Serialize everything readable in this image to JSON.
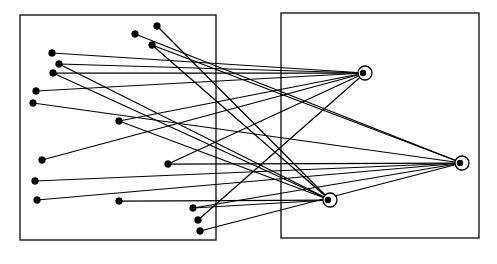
{
  "figure": {
    "canvas": {
      "width": 497,
      "height": 264
    },
    "background_color": "#ffffff",
    "stroke_color": "#000000",
    "box_stroke_color": "#1a1a1a"
  },
  "regions": [
    {
      "name": "left-region",
      "x": 20,
      "y": 15,
      "width": 196,
      "height": 225
    },
    {
      "name": "right-region",
      "x": 281,
      "y": 13,
      "width": 198,
      "height": 225
    }
  ],
  "chart_data": {
    "type": "scatter",
    "xlabel": "",
    "ylabel": "",
    "xlim": [
      0,
      497
    ],
    "ylim": [
      0,
      264
    ],
    "grid": false,
    "legend": "none",
    "series": [
      {
        "name": "source-nodes",
        "marker": "filled-circle",
        "radius": 3.4,
        "color": "#000000",
        "points": [
          {
            "id": "s1",
            "x": 157,
            "y": 26
          },
          {
            "id": "s2",
            "x": 135,
            "y": 34
          },
          {
            "id": "s3",
            "x": 152,
            "y": 45
          },
          {
            "id": "s4",
            "x": 52,
            "y": 53
          },
          {
            "id": "s5",
            "x": 59,
            "y": 64
          },
          {
            "id": "s6",
            "x": 53,
            "y": 73
          },
          {
            "id": "s7",
            "x": 36,
            "y": 91
          },
          {
            "id": "s8",
            "x": 33,
            "y": 103
          },
          {
            "id": "s9",
            "x": 119,
            "y": 121
          },
          {
            "id": "s10",
            "x": 42,
            "y": 160
          },
          {
            "id": "s11",
            "x": 168,
            "y": 164
          },
          {
            "id": "s12",
            "x": 35,
            "y": 181
          },
          {
            "id": "s13",
            "x": 37,
            "y": 200
          },
          {
            "id": "s14",
            "x": 119,
            "y": 201
          },
          {
            "id": "s15",
            "x": 193,
            "y": 208
          },
          {
            "id": "s16",
            "x": 198,
            "y": 220
          },
          {
            "id": "s17",
            "x": 200,
            "y": 231
          }
        ]
      },
      {
        "name": "hub-nodes",
        "marker": "ring-with-core",
        "outer_radius": 7,
        "core_radius": 3.2,
        "ring_color": "#000000",
        "fill_color": "#ffffff",
        "points": [
          {
            "id": "h1",
            "x": 365,
            "y": 73
          },
          {
            "id": "h2",
            "x": 462,
            "y": 163
          },
          {
            "id": "h3",
            "x": 330,
            "y": 200
          }
        ]
      }
    ],
    "edges": [
      {
        "from": "s1",
        "to": "h3"
      },
      {
        "from": "s2",
        "to": "h2"
      },
      {
        "from": "s3",
        "to": "h3"
      },
      {
        "from": "s4",
        "to": "h1"
      },
      {
        "from": "s5",
        "to": "h1"
      },
      {
        "from": "s6",
        "to": "h1"
      },
      {
        "from": "s7",
        "to": "h1"
      },
      {
        "from": "s8",
        "to": "h2"
      },
      {
        "from": "s9",
        "to": "h1"
      },
      {
        "from": "s10",
        "to": "h1"
      },
      {
        "from": "s11",
        "to": "h1"
      },
      {
        "from": "s12",
        "to": "h2"
      },
      {
        "from": "s13",
        "to": "h2"
      },
      {
        "from": "s14",
        "to": "h3"
      },
      {
        "from": "s15",
        "to": "h3"
      },
      {
        "from": "s16",
        "to": "h1"
      },
      {
        "from": "s17",
        "to": "h2"
      },
      {
        "from": "s5",
        "to": "h3"
      },
      {
        "from": "s6",
        "to": "h3"
      },
      {
        "from": "s3",
        "to": "h2"
      },
      {
        "from": "s11",
        "to": "h2"
      },
      {
        "from": "s15",
        "to": "h2"
      },
      {
        "from": "s9",
        "to": "h3"
      }
    ]
  }
}
